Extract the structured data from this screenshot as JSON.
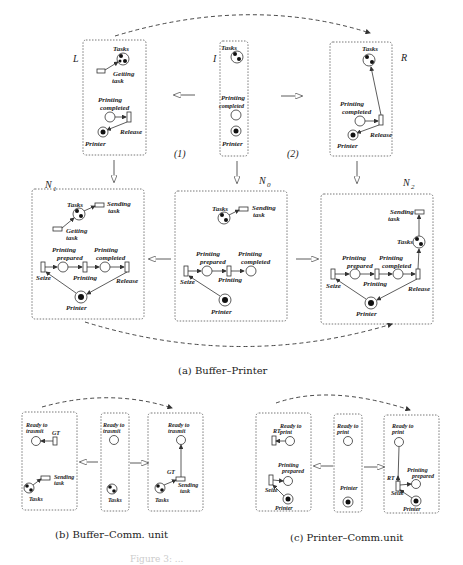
{
  "panels": {
    "a": {
      "caption": "(a) Buffer–Printer",
      "rule_labels": {
        "L": "L",
        "I": "I",
        "R": "R",
        "N1": "N",
        "N1_sub": "1",
        "N0": "N",
        "N0_sub": "0",
        "N2": "N",
        "N2_sub": "2",
        "step1": "(1)",
        "step2": "(2)"
      },
      "L": {
        "tasks": "Tasks",
        "getting_task_1": "Getting",
        "getting_task_2": "task",
        "printing_completed_1": "Printing",
        "printing_completed_2": "completed",
        "release": "Release",
        "printer": "Printer"
      },
      "I": {
        "tasks": "Tasks",
        "printing_completed_1": "Printing",
        "printing_completed_2": "completed",
        "printer": "Printer"
      },
      "R": {
        "tasks": "Tasks",
        "printing_completed_1": "Printing",
        "printing_completed_2": "completed",
        "release": "Release",
        "printer": "Printer"
      },
      "N1": {
        "tasks": "Tasks",
        "sending_task_1": "Sending",
        "sending_task_2": "task",
        "getting_task_1": "Getting",
        "getting_task_2": "task",
        "printing_prepared_1": "Printing",
        "printing_prepared_2": "prepared",
        "printing_completed_1": "Printing",
        "printing_completed_2": "completed",
        "seize": "Seize",
        "printing": "Printing",
        "release": "Release",
        "printer": "Printer"
      },
      "N0": {
        "tasks": "Tasks",
        "sending_task_1": "Sending",
        "sending_task_2": "task",
        "printing_prepared_1": "Printing",
        "printing_prepared_2": "prepared",
        "printing_completed_1": "Printing",
        "printing_completed_2": "completed",
        "seize": "Seize",
        "printing": "Printing",
        "printer": "Printer"
      },
      "N2": {
        "tasks": "Tasks",
        "sending_task_1": "Sending",
        "sending_task_2": "task",
        "printing_prepared_1": "Printing",
        "printing_prepared_2": "prepared",
        "printing_completed_1": "Printing",
        "printing_completed_2": "completed",
        "seize": "Seize",
        "printing": "Printing",
        "release": "Release",
        "printer": "Printer"
      }
    },
    "b": {
      "caption": "(b) Buffer–Comm. unit",
      "left": {
        "ready_1": "Ready to",
        "ready_2": "trasmit",
        "gt": "GT",
        "sending_1": "Sending",
        "sending_2": "task",
        "tasks": "Tasks"
      },
      "mid": {
        "ready_1": "Ready to",
        "ready_2": "trasmit",
        "tasks": "Tasks"
      },
      "right": {
        "ready_1": "Ready to",
        "ready_2": "trasmit",
        "gt": "GT",
        "sending_1": "Sending",
        "sending_2": "task",
        "tasks": "Tasks"
      }
    },
    "c": {
      "caption": "(c) Printer–Comm.unit",
      "left": {
        "ready_1": "Ready to",
        "ready_2": "print",
        "rt": "RT",
        "prepared_1": "Printing",
        "prepared_2": "prepared",
        "seize": "Seize",
        "printer": "Printer"
      },
      "mid": {
        "ready_1": "Ready to",
        "ready_2": "print",
        "printer": "Printer"
      },
      "right": {
        "ready_1": "Ready to",
        "ready_2": "print",
        "rt": "RT",
        "prepared_1": "Printing",
        "prepared_2": "prepared",
        "seize": "Seize",
        "printer": "Printer"
      }
    }
  },
  "figure_caption": "Figure 3: ..."
}
